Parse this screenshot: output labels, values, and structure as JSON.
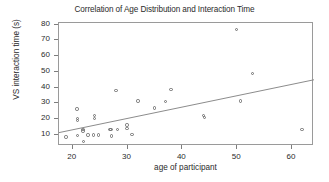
{
  "chart_data": {
    "type": "scatter",
    "title": "Correlation of Age Distribution and Interaction Time",
    "xlabel": "age of participant",
    "ylabel": "VS interaction time (s)",
    "xlim": [
      17.5,
      64.0
    ],
    "ylim": [
      3.0,
      81.0
    ],
    "xticks": [
      20,
      30,
      40,
      50,
      60
    ],
    "yticks": [
      10,
      20,
      30,
      40,
      50,
      60,
      70,
      80
    ],
    "xtick_labels": [
      "20",
      "30",
      "40",
      "50",
      "60"
    ],
    "ytick_labels": [
      "10",
      "20",
      "30",
      "40",
      "50",
      "60",
      "70",
      "80"
    ],
    "grid": false,
    "legend": false,
    "marker": "open-circle",
    "marker_color": "#6f6f6f",
    "frame_color": "#9a9a9a",
    "trend_line": {
      "color": "#8c8c8c",
      "x": [
        17.5,
        64.0
      ],
      "y": [
        11.5,
        45.0
      ]
    },
    "points": [
      {
        "x": 18.8,
        "y": 8.6
      },
      {
        "x": 20.8,
        "y": 26.5
      },
      {
        "x": 20.9,
        "y": 20.3
      },
      {
        "x": 20.9,
        "y": 19.3
      },
      {
        "x": 20.9,
        "y": 9.8
      },
      {
        "x": 21.9,
        "y": 13.5
      },
      {
        "x": 21.9,
        "y": 12.6
      },
      {
        "x": 22.0,
        "y": 6.0
      },
      {
        "x": 22.8,
        "y": 10.0
      },
      {
        "x": 23.8,
        "y": 10.0
      },
      {
        "x": 24.0,
        "y": 22.3
      },
      {
        "x": 24.0,
        "y": 20.6
      },
      {
        "x": 24.7,
        "y": 10.0
      },
      {
        "x": 26.8,
        "y": 13.4
      },
      {
        "x": 27.0,
        "y": 13.3
      },
      {
        "x": 27.1,
        "y": 9.3
      },
      {
        "x": 27.9,
        "y": 38.0
      },
      {
        "x": 28.2,
        "y": 13.4
      },
      {
        "x": 29.9,
        "y": 16.4
      },
      {
        "x": 29.9,
        "y": 14.0
      },
      {
        "x": 30.8,
        "y": 10.3
      },
      {
        "x": 31.9,
        "y": 31.6
      },
      {
        "x": 34.9,
        "y": 27.0
      },
      {
        "x": 36.9,
        "y": 31.4
      },
      {
        "x": 37.9,
        "y": 39.0
      },
      {
        "x": 43.9,
        "y": 22.4
      },
      {
        "x": 44.0,
        "y": 21.0
      },
      {
        "x": 49.9,
        "y": 77.0
      },
      {
        "x": 50.6,
        "y": 31.5
      },
      {
        "x": 52.8,
        "y": 49.0
      },
      {
        "x": 61.8,
        "y": 13.5
      }
    ]
  }
}
